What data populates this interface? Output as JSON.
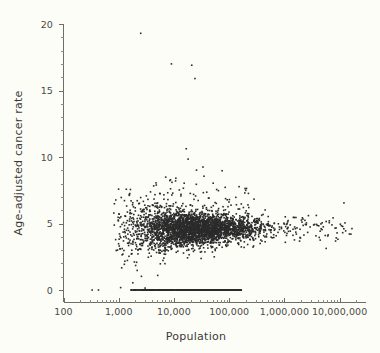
{
  "chart_data": {
    "type": "scatter",
    "title": "",
    "xlabel": "Population",
    "ylabel": "Age-adjusted cancer rate",
    "xscale": "log",
    "yscale": "linear",
    "xlim": [
      100,
      30000000
    ],
    "ylim": [
      -0.9,
      20
    ],
    "grid": false,
    "legend": "none",
    "marker": {
      "shape": "square",
      "size_px": 1.6,
      "color": "#2b2b2b"
    },
    "x_ticks": [
      {
        "value": 100,
        "label": "100"
      },
      {
        "value": 1000,
        "label": "1,000"
      },
      {
        "value": 10000,
        "label": "10,000"
      },
      {
        "value": 100000,
        "label": "100,000"
      },
      {
        "value": 1000000,
        "label": "1,000,000"
      },
      {
        "value": 10000000,
        "label": "10,000,000"
      }
    ],
    "y_ticks": [
      {
        "value": 0,
        "label": "0"
      },
      {
        "value": 5,
        "label": "5"
      },
      {
        "value": 10,
        "label": "10"
      },
      {
        "value": 15,
        "label": "15"
      },
      {
        "value": 20,
        "label": "20"
      }
    ],
    "y_minor_step": 1,
    "n_points": 3142,
    "zero_band": {
      "y": 0,
      "x_min": 1600,
      "x_max": 170000,
      "n_points": 420,
      "outliers_x": [
        330,
        430
      ]
    },
    "converged_value": 4.6,
    "notable_points": [
      {
        "x": 2500,
        "y": 19.3,
        "note": "topmost outlier"
      },
      {
        "x": 9000,
        "y": 17.0
      },
      {
        "x": 21000,
        "y": 16.9
      },
      {
        "x": 24000,
        "y": 15.9
      },
      {
        "x": 16000000,
        "y": 4.2,
        "note": "largest population"
      },
      {
        "x": 6500000,
        "y": 5.2
      }
    ],
    "series": [
      {
        "name": "Counties",
        "x": [
          2500,
          9000,
          21000,
          24000,
          16000000,
          6500000
        ],
        "y": [
          19.3,
          17.0,
          16.9,
          15.9,
          4.2,
          5.2
        ]
      }
    ]
  },
  "axes": {
    "x_title": "Population",
    "y_title": "Age-adjusted cancer rate"
  }
}
